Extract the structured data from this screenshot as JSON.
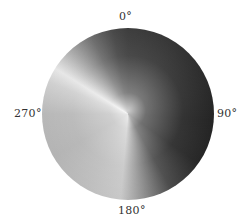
{
  "figure": {
    "type": "polar-gradient-disc",
    "labels": {
      "top": "0°",
      "right": "90°",
      "bottom": "180°",
      "left": "270°"
    },
    "colors": {
      "background": "#ffffff",
      "darkest": "#222222",
      "brightest": "#e6e6e6",
      "label_text": "#333333"
    }
  }
}
